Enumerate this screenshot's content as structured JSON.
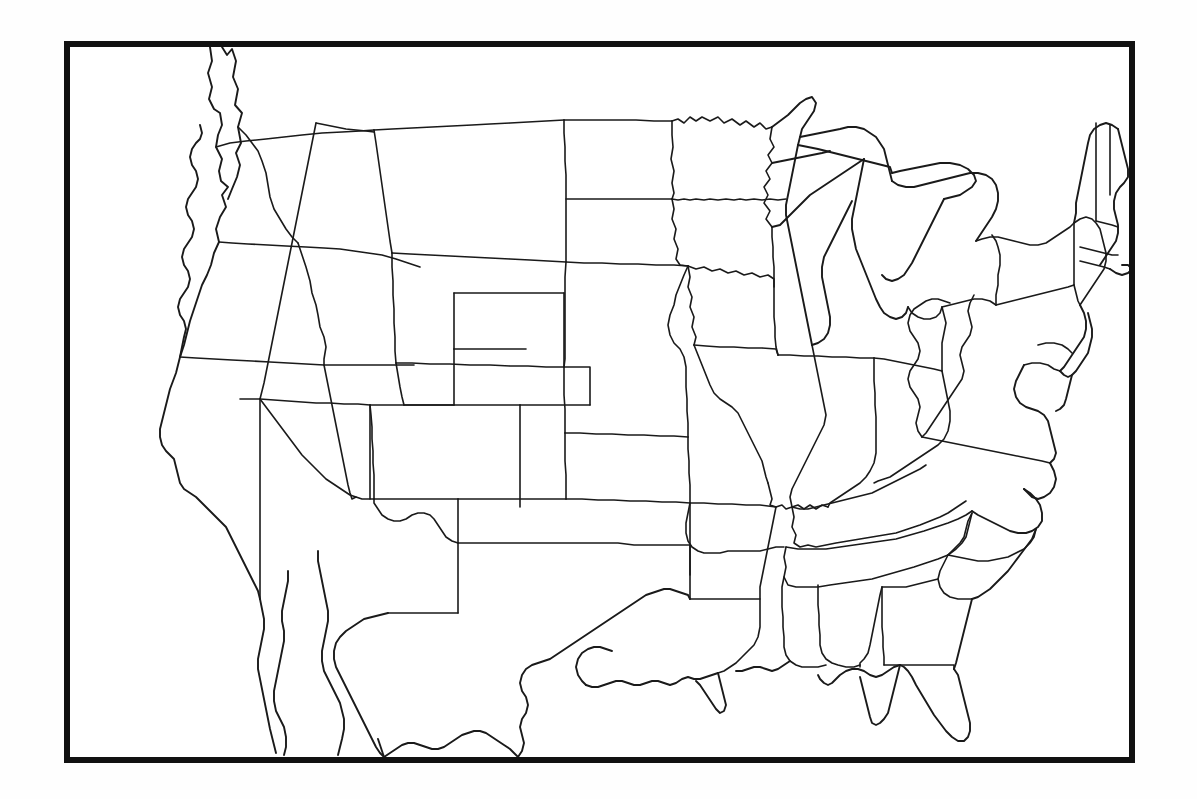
{
  "document": {
    "type": "map",
    "title": "Blank outline map of the contiguous United States",
    "description": "Unlabeled political outline map showing the 48 contiguous states with state boundary lines, enclosed by a thick rectangular border frame.",
    "has_labels": false,
    "has_legend": false,
    "has_scale_bar": false,
    "has_compass_rose": false,
    "has_graticule": false
  },
  "canvas": {
    "width_px": 1197,
    "height_px": 799,
    "background_color": "#fefefe"
  },
  "frame": {
    "left_px": 64,
    "top_px": 41,
    "width_px": 1071,
    "height_px": 722,
    "border_width_px": 6,
    "border_color": "#111111",
    "fill_color": "#ffffff"
  },
  "style": {
    "boundary_stroke_color": "#1a1a1a",
    "boundary_stroke_width_px": 1.6,
    "coastline_stroke_width_px": 1.9,
    "land_fill_color": "none"
  },
  "map_content": {
    "region": "Contiguous United States",
    "state_count": 48,
    "features_visible": [
      "pacific-coastline",
      "atlantic-coastline",
      "gulf-of-mexico-coastline",
      "great-lakes",
      "puget-sound",
      "chesapeake-bay",
      "delmarva-peninsula",
      "florida-peninsula",
      "cape-cod",
      "long-island",
      "outer-banks",
      "baja-california-peninsula",
      "canada-border",
      "mexico-border",
      "michigan-upper-peninsula",
      "michigan-lower-peninsula"
    ]
  }
}
